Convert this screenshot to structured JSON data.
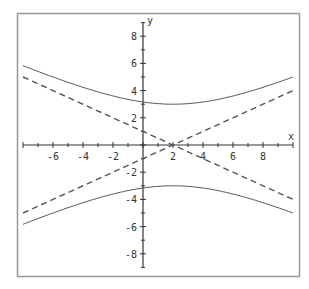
{
  "chart_data": {
    "type": "line",
    "title": "",
    "xlabel": "x",
    "ylabel": "y",
    "xlim": [
      -8,
      10
    ],
    "ylim": [
      -9,
      9
    ],
    "x_ticks": [
      -6,
      -4,
      -2,
      2,
      4,
      6,
      8
    ],
    "y_ticks": [
      8,
      6,
      4,
      2,
      -2,
      -4,
      -6,
      -8
    ],
    "grid": false,
    "legend": null,
    "series": [
      {
        "name": "hyperbola-upper-branch",
        "style": "solid",
        "equation": "y = 3*sqrt(1 + ((x-2)/6)^2)",
        "points": [
          [
            -8,
            5.83
          ],
          [
            -6,
            5.0
          ],
          [
            -4,
            4.24
          ],
          [
            -2,
            3.61
          ],
          [
            0,
            3.16
          ],
          [
            2,
            3.0
          ],
          [
            4,
            3.16
          ],
          [
            6,
            3.61
          ],
          [
            8,
            4.24
          ],
          [
            10,
            5.0
          ]
        ]
      },
      {
        "name": "hyperbola-lower-branch",
        "style": "solid",
        "equation": "y = -3*sqrt(1 + ((x-2)/6)^2)",
        "points": [
          [
            -8,
            -5.83
          ],
          [
            -6,
            -5.0
          ],
          [
            -4,
            -4.24
          ],
          [
            -2,
            -3.61
          ],
          [
            0,
            -3.16
          ],
          [
            2,
            -3.0
          ],
          [
            4,
            -3.16
          ],
          [
            6,
            -3.61
          ],
          [
            8,
            -4.24
          ],
          [
            10,
            -5.0
          ]
        ]
      },
      {
        "name": "asymptote-decreasing",
        "style": "dashed",
        "equation": "y = -(x-2)/2",
        "points": [
          [
            -8,
            5
          ],
          [
            10,
            -4
          ]
        ]
      },
      {
        "name": "asymptote-increasing",
        "style": "dashed",
        "equation": "y = (x-2)/2",
        "points": [
          [
            -8,
            -5
          ],
          [
            10,
            4
          ]
        ]
      }
    ]
  },
  "axes": {
    "x_label": "x",
    "y_label": "y"
  },
  "colors": {
    "curve": "#555555",
    "axis": "#333333",
    "frame": "#999999"
  }
}
